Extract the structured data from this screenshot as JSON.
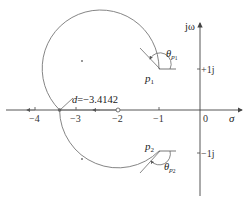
{
  "diagram": {
    "type": "root-locus",
    "axes": {
      "real_label": "σ",
      "imag_label": "jω",
      "real_ticks": [
        "−4",
        "−3",
        "−2",
        "−1",
        "0"
      ],
      "imag_ticks": [
        "+1j",
        "−1j"
      ]
    },
    "breakaway": {
      "label": "d=−3.4142",
      "value": -3.4142
    },
    "zero": {
      "value": -2
    },
    "poles": [
      {
        "label": "p",
        "sub": "1",
        "value": "-1+1j"
      },
      {
        "label": "p",
        "sub": "2",
        "value": "-1-1j"
      }
    ],
    "angles": [
      {
        "label": "θ",
        "sub": "p1"
      },
      {
        "label": "θ",
        "sub": "p2"
      }
    ],
    "colors": {
      "axis": "#444444",
      "locus": "#777777",
      "text": "#222222"
    }
  }
}
